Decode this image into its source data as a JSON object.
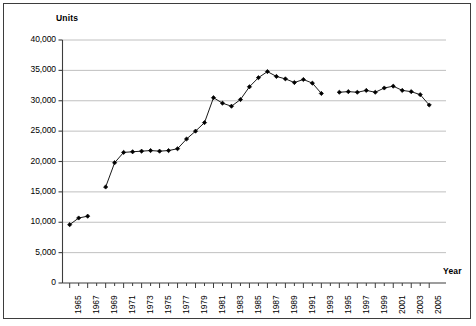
{
  "chart_data": {
    "type": "line",
    "title": "",
    "xlabel": "Year",
    "ylabel": "Units",
    "xlim": [
      1964.2,
      2006.2
    ],
    "ylim": [
      0,
      40000
    ],
    "grid": true,
    "grid_axis": "y",
    "legend": "none",
    "marker": "diamond",
    "line_color": "#1a1a1a",
    "marker_color": "#000000",
    "grid_color": "#b9b9b9",
    "axis_color": "#3d3d3d",
    "y_ticks": [
      0,
      5000,
      10000,
      15000,
      20000,
      25000,
      30000,
      35000,
      40000
    ],
    "y_tick_labels": [
      "0",
      "5,000",
      "10,000",
      "15,000",
      "20,000",
      "25,000",
      "30,000",
      "35,000",
      "40,000"
    ],
    "x_ticks": [
      1965,
      1966,
      1967,
      1968,
      1969,
      1970,
      1971,
      1972,
      1973,
      1974,
      1975,
      1976,
      1977,
      1978,
      1979,
      1980,
      1981,
      1982,
      1983,
      1984,
      1985,
      1986,
      1987,
      1988,
      1989,
      1990,
      1991,
      1992,
      1993,
      1994,
      1995,
      1996,
      1997,
      1998,
      1999,
      2000,
      2001,
      2002,
      2003,
      2004,
      2005
    ],
    "x_tick_labels": [
      "1965",
      "",
      "1967",
      "",
      "1969",
      "",
      "1971",
      "",
      "1973",
      "",
      "1975",
      "",
      "1977",
      "",
      "1979",
      "",
      "1981",
      "",
      "1983",
      "",
      "1985",
      "",
      "1987",
      "",
      "1989",
      "",
      "1991",
      "",
      "1993",
      "",
      "1995",
      "",
      "1997",
      "",
      "1999",
      "",
      "2001",
      "",
      "2003",
      "",
      "2005"
    ],
    "series": [
      {
        "name": "Units",
        "x": [
          1965,
          1966,
          1967,
          1969,
          1970,
          1971,
          1972,
          1973,
          1974,
          1975,
          1976,
          1977,
          1978,
          1979,
          1980,
          1981,
          1982,
          1983,
          1984,
          1985,
          1986,
          1987,
          1988,
          1989,
          1990,
          1991,
          1992,
          1993,
          1995,
          1996,
          1997,
          1998,
          1999,
          2000,
          2001,
          2002,
          2003,
          2004,
          2005
        ],
        "values": [
          9600,
          10700,
          11000,
          15800,
          19800,
          21500,
          21600,
          21700,
          21800,
          21700,
          21800,
          22100,
          23700,
          25000,
          26400,
          30500,
          29600,
          29100,
          30200,
          32300,
          33800,
          34800,
          34000,
          33600,
          33000,
          33500,
          32900,
          31200,
          31400,
          31500,
          31400,
          31700,
          31400,
          32100,
          32400,
          31700,
          31500,
          31000,
          29300
        ]
      }
    ],
    "gaps": [
      {
        "after": 1967,
        "before": 1969
      },
      {
        "after": 1993,
        "before": 1995
      }
    ]
  }
}
